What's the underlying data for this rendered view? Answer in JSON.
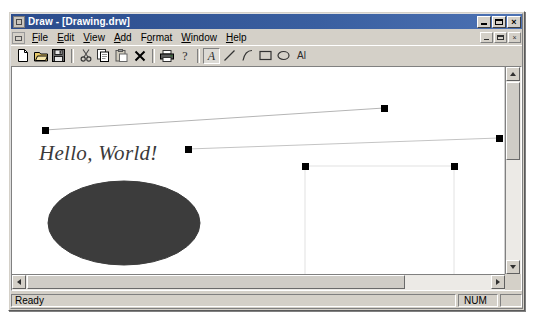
{
  "window": {
    "title": "Draw - [Drawing.drw]",
    "icon": "app-icon",
    "buttons": {
      "minimize": "_",
      "maximize": "□",
      "close": "×"
    },
    "mdi_buttons": {
      "minimize": "_",
      "restore": "□",
      "close": "×"
    }
  },
  "menu": {
    "items": [
      {
        "label": "File",
        "accel": "F"
      },
      {
        "label": "Edit",
        "accel": "E"
      },
      {
        "label": "View",
        "accel": "V"
      },
      {
        "label": "Add",
        "accel": "A"
      },
      {
        "label": "Format",
        "accel": "o"
      },
      {
        "label": "Window",
        "accel": "W"
      },
      {
        "label": "Help",
        "accel": "H"
      }
    ]
  },
  "toolbar": {
    "buttons": [
      {
        "name": "new-icon",
        "label": "New"
      },
      {
        "name": "open-icon",
        "label": "Open"
      },
      {
        "name": "save-icon",
        "label": "Save"
      },
      {
        "name": "cut-icon",
        "label": "Cut"
      },
      {
        "name": "copy-icon",
        "label": "Copy"
      },
      {
        "name": "paste-icon",
        "label": "Paste"
      },
      {
        "name": "delete-icon",
        "label": "Delete"
      },
      {
        "name": "print-icon",
        "label": "Print"
      },
      {
        "name": "help-icon",
        "label": "About"
      },
      {
        "name": "text-tool-icon",
        "label": "Text",
        "pressed": true
      },
      {
        "name": "line-tool-icon",
        "label": "Line"
      },
      {
        "name": "curve-tool-icon",
        "label": "Curve"
      },
      {
        "name": "rectangle-tool-icon",
        "label": "Rectangle"
      },
      {
        "name": "ellipse-tool-icon",
        "label": "Ellipse"
      },
      {
        "name": "ai-tool-icon",
        "label": "Al"
      }
    ]
  },
  "canvas": {
    "text_object": {
      "content": "Hello, World!",
      "x": 27,
      "y": 74,
      "font_size": 21,
      "color": "#3a3a3a",
      "style": "italic serif"
    },
    "shapes": [
      {
        "type": "line",
        "name": "line-1",
        "x1": 33,
        "y1": 118,
        "x2": 372,
        "y2": 96,
        "stroke": "#b0b0b0",
        "selected": true,
        "handles": [
          [
            33,
            118
          ],
          [
            372,
            96
          ]
        ]
      },
      {
        "type": "line",
        "name": "line-2",
        "x1": 176,
        "y1": 137,
        "x2": 487,
        "y2": 126,
        "stroke": "#b0b0b0",
        "selected": true,
        "handles": [
          [
            176,
            137
          ],
          [
            487,
            126
          ]
        ]
      },
      {
        "type": "ellipse",
        "name": "ellipse-1",
        "cx": 112,
        "cy": 211,
        "rx": 76,
        "ry": 42,
        "fill": "#3c3c3c",
        "stroke": "#3c3c3c",
        "selected": false
      },
      {
        "type": "rectangle",
        "name": "rectangle-1",
        "x": 293,
        "y": 154,
        "width": 149,
        "height": 112,
        "fill": "none",
        "stroke": "#e0e0e0",
        "selected": true,
        "handles": [
          [
            293,
            154
          ],
          [
            442,
            154
          ],
          [
            293,
            266
          ],
          [
            442,
            266
          ]
        ]
      }
    ]
  },
  "scrollbars": {
    "vertical": {
      "up": "▲",
      "down": "▼",
      "thumb_top": 0,
      "thumb_size": 78
    },
    "horizontal": {
      "left": "◀",
      "right": "▶",
      "thumb_left": 0,
      "thumb_size": 378
    }
  },
  "status_bar": {
    "message": "Ready",
    "num_lock": "NUM",
    "extra": ""
  }
}
